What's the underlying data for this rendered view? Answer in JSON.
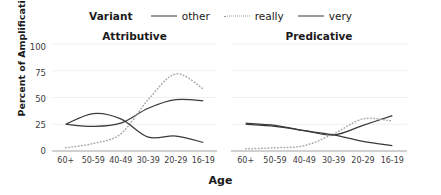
{
  "chart_data": {
    "type": "line",
    "title": "",
    "xlabel": "Age",
    "ylabel": "Percent of Amplification",
    "ylim": [
      0,
      100
    ],
    "yticks": [
      100,
      75,
      50,
      25,
      0
    ],
    "grid": true,
    "legend_title": "Variant",
    "legend_position": "top-center",
    "categories": [
      "60+",
      "50-59",
      "40-49",
      "30-39",
      "20-29",
      "16-19"
    ],
    "facets": [
      {
        "name": "Attributive",
        "series": [
          {
            "name": "other",
            "style": "solid",
            "color": "#3a3a3a",
            "values": [
              25,
              23,
              26,
              40,
              48,
              47
            ]
          },
          {
            "name": "really",
            "style": "dotted",
            "color": "#a8a8a8",
            "values": [
              3,
              7,
              16,
              48,
              72,
              58
            ]
          },
          {
            "name": "very",
            "style": "solid",
            "color": "#3a3a3a",
            "values": [
              25,
              35,
              30,
              13,
              14,
              8
            ]
          }
        ]
      },
      {
        "name": "Predicative",
        "series": [
          {
            "name": "other",
            "style": "solid",
            "color": "#3a3a3a",
            "values": [
              26,
              24,
              19,
              15,
              24,
              33
            ]
          },
          {
            "name": "really",
            "style": "dotted",
            "color": "#a8a8a8",
            "values": [
              2,
              3,
              5,
              16,
              30,
              28
            ]
          },
          {
            "name": "very",
            "style": "solid",
            "color": "#3a3a3a",
            "values": [
              25,
              23,
              19,
              15,
              9,
              5
            ]
          }
        ]
      }
    ],
    "legend_entries": [
      {
        "label": "other",
        "style": "solid"
      },
      {
        "label": "really",
        "style": "dotted"
      },
      {
        "label": "very",
        "style": "solid"
      }
    ]
  }
}
